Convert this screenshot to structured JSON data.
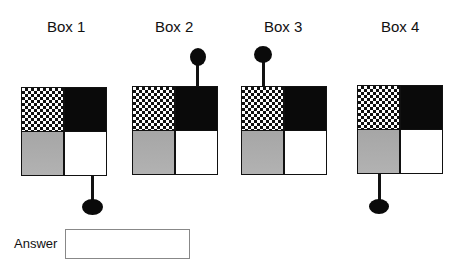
{
  "boxes": [
    {
      "label": "Box 1",
      "knob_position": "bottom",
      "knob_side": "right"
    },
    {
      "label": "Box 2",
      "knob_position": "top",
      "knob_side": "right"
    },
    {
      "label": "Box 3",
      "knob_position": "top",
      "knob_side": "left"
    },
    {
      "label": "Box 4",
      "knob_position": "bottom",
      "knob_side": "left"
    }
  ],
  "quadrants": {
    "top_left": "checkered",
    "top_right": "black",
    "bottom_left": "gray",
    "bottom_right": "white"
  },
  "colors": {
    "black": "#0a0a0a",
    "gray": "#aaaaaa",
    "white": "#ffffff"
  },
  "answer": {
    "label": "Answer",
    "value": "",
    "placeholder": ""
  }
}
